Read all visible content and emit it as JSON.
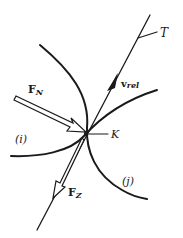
{
  "diagram": {
    "colors": {
      "ink": "#1a1a1a",
      "background": "#ffffff"
    },
    "labels": {
      "tangent": "T",
      "velocity_main": "v",
      "velocity_sub": "rel",
      "normal_force_main": "F",
      "normal_force_sub": "N",
      "friction_force_main": "F",
      "friction_force_sub": "Z",
      "contact_point": "K",
      "body_i": "(i)",
      "body_j": "(j)"
    },
    "elements": [
      {
        "id": "tangent-line",
        "type": "line",
        "from": [
          150,
          15
        ],
        "to": [
          37,
          230
        ]
      },
      {
        "id": "velocity-arrow",
        "type": "arrow",
        "direction": "along tangent toward T"
      },
      {
        "id": "normal-force-arrow",
        "type": "hollow-arrow",
        "direction": "toward K from upper-left"
      },
      {
        "id": "friction-force-arrow",
        "type": "hollow-arrow",
        "direction": "from K down-left along tangent"
      },
      {
        "id": "body-i-contour",
        "type": "curve"
      },
      {
        "id": "body-j-contour",
        "type": "curve"
      }
    ]
  }
}
